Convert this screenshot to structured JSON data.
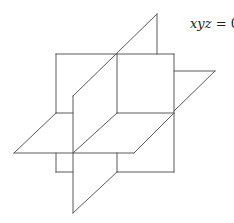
{
  "figure": {
    "label_var": "xyz",
    "label_rest": " = 0",
    "stroke_color": "#5a5a5a",
    "background": "#ffffff"
  }
}
